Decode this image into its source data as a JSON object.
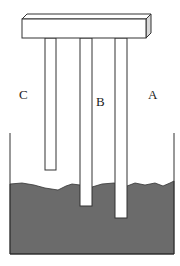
{
  "diagram": {
    "labels": {
      "rod_c": "C",
      "rod_b": "B",
      "rod_a": "A"
    },
    "colors": {
      "soil": "#6b6b6b",
      "line": "#333333",
      "bar_side": "#d8d8d8",
      "background": "#ffffff"
    },
    "rods": [
      {
        "name": "C",
        "length": "short",
        "in_soil": false
      },
      {
        "name": "B",
        "length": "medium",
        "in_soil": true
      },
      {
        "name": "A",
        "length": "long",
        "in_soil": true
      }
    ]
  }
}
